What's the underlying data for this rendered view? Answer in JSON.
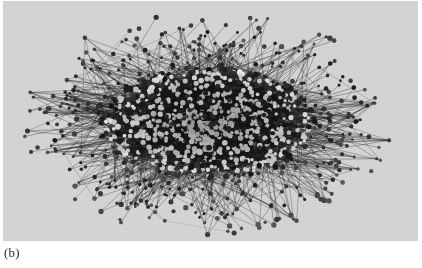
{
  "figure": {
    "caption_label": "(b)",
    "panel": {
      "background_color": "#d6d6d6",
      "width": 415,
      "height": 240,
      "x": 3,
      "y": 1
    },
    "visual_type": "network-graph",
    "colors": {
      "background": "#d6d6d6",
      "edge_dark": "#1a1a1a",
      "edge_light": "#6e6e6e",
      "node_bright": "#ffffff",
      "node_dark": "#202020",
      "caption_text": "#2b2b2b"
    }
  },
  "chart_data": {
    "type": "scatter",
    "title": "",
    "subtitle": "",
    "xlabel": "",
    "ylabel": "",
    "grid": false,
    "legend": "none",
    "axes_visible": false,
    "tick_labels_x": [],
    "tick_labels_y": [],
    "xlim": [
      0,
      415
    ],
    "ylim": [
      0,
      240
    ],
    "annotations": [
      "(b)"
    ],
    "layout": {
      "core_center_x": 205,
      "core_center_y": 122,
      "core_radius_x": 108,
      "core_radius_y": 56,
      "halo_radius_x": 165,
      "halo_radius_y": 96,
      "outlier_radius_x": 190,
      "outlier_radius_y": 112
    },
    "series": [
      {
        "name": "core-nodes",
        "count": 900,
        "marker": "dot",
        "marker_size": 2.2,
        "color": "#ffffff"
      },
      {
        "name": "halo-nodes",
        "count": 420,
        "marker": "dot",
        "marker_size": 1.8,
        "color": "#2a2a2a"
      },
      {
        "name": "outlier-nodes",
        "count": 150,
        "marker": "dot",
        "marker_size": 2.0,
        "color": "#3a3a3a"
      },
      {
        "name": "edges",
        "count": 3400,
        "color": "#303030",
        "width": 0.6
      }
    ]
  }
}
